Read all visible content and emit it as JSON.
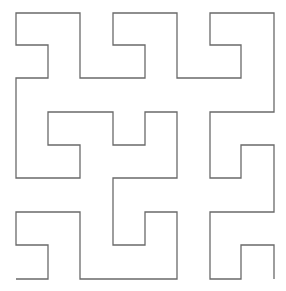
{
  "figure": {
    "type": "hilbert-space-filling-curve",
    "order": 3,
    "stroke_color": "#6a6a6a",
    "stroke_width": 1.3,
    "background": "#ffffff",
    "points": [
      [
        16,
        279
      ],
      [
        48,
        279
      ],
      [
        48,
        245
      ],
      [
        16,
        245
      ],
      [
        16,
        212
      ],
      [
        80,
        212
      ],
      [
        80,
        279
      ],
      [
        177,
        279
      ],
      [
        177,
        212
      ],
      [
        145,
        212
      ],
      [
        145,
        245
      ],
      [
        113,
        245
      ],
      [
        113,
        178
      ],
      [
        177,
        178
      ],
      [
        177,
        112
      ],
      [
        145,
        112
      ],
      [
        145,
        145
      ],
      [
        113,
        145
      ],
      [
        113,
        112
      ],
      [
        48,
        112
      ],
      [
        48,
        145
      ],
      [
        80,
        145
      ],
      [
        80,
        178
      ],
      [
        16,
        178
      ],
      [
        16,
        78
      ],
      [
        48,
        78
      ],
      [
        48,
        45
      ],
      [
        16,
        45
      ],
      [
        16,
        13
      ],
      [
        80,
        13
      ],
      [
        80,
        78
      ],
      [
        145,
        78
      ],
      [
        145,
        45
      ],
      [
        113,
        45
      ],
      [
        113,
        13
      ],
      [
        177,
        13
      ],
      [
        177,
        78
      ],
      [
        241,
        78
      ],
      [
        241,
        45
      ],
      [
        210,
        45
      ],
      [
        210,
        13
      ],
      [
        274,
        13
      ],
      [
        274,
        112
      ],
      [
        210,
        112
      ],
      [
        210,
        178
      ],
      [
        241,
        178
      ],
      [
        241,
        145
      ],
      [
        274,
        145
      ],
      [
        274,
        212
      ],
      [
        210,
        212
      ],
      [
        210,
        279
      ],
      [
        241,
        279
      ],
      [
        241,
        245
      ],
      [
        274,
        245
      ],
      [
        274,
        279
      ]
    ]
  }
}
